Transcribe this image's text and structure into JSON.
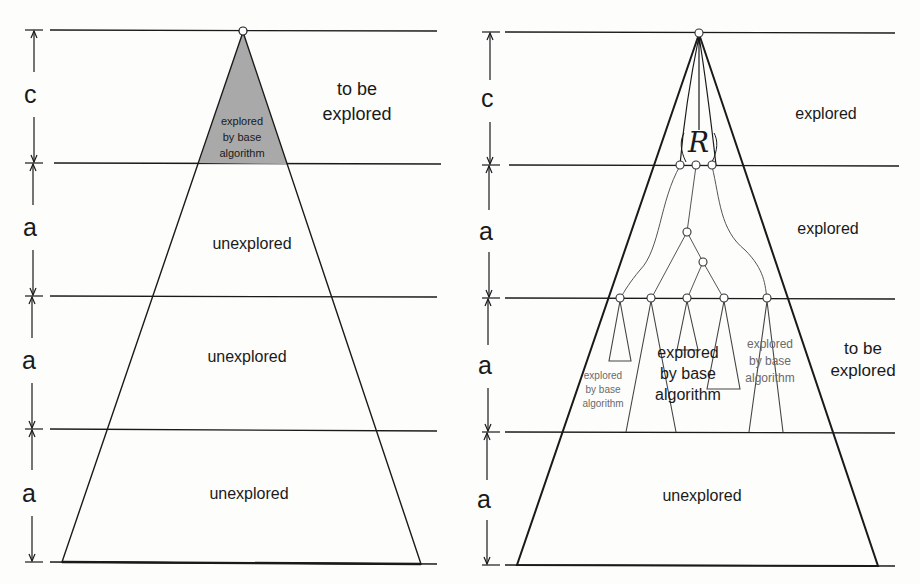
{
  "left_panel": {
    "dimensions": [
      "c",
      "a",
      "a",
      "a"
    ],
    "labels": {
      "top_right": [
        "to be",
        "explored"
      ],
      "shaded": [
        "explored",
        "by base",
        "algorithm"
      ],
      "band1": "unexplored",
      "band2": "unexplored",
      "band3": "unexplored"
    },
    "shade_color": "#a9a9a9"
  },
  "right_panel": {
    "dimensions": [
      "c",
      "a",
      "a",
      "a"
    ],
    "root_region_symbol": "R",
    "labels": {
      "band0": "explored",
      "band1": "explored",
      "band2_right": [
        "to be",
        "explored"
      ],
      "subtree_small_left": [
        "explored",
        "by base",
        "algorithm"
      ],
      "subtree_center": [
        "explored",
        "by base",
        "algorithm"
      ],
      "subtree_right": [
        "explored",
        "by base",
        "algorithm"
      ],
      "band3": "unexplored"
    }
  }
}
